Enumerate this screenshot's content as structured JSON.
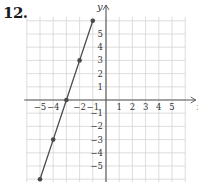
{
  "problem": {
    "number": "12."
  },
  "chart_data": {
    "type": "line",
    "title": "",
    "xlabel": "x",
    "ylabel": "y",
    "xlim": [
      -6,
      6
    ],
    "ylim": [
      -6,
      6
    ],
    "grid": true,
    "x_tick_labels": [
      "−5",
      "−4",
      "−2",
      "−1",
      "1",
      "2",
      "3",
      "4",
      "5"
    ],
    "x_tick_values": [
      -5,
      -4,
      -2,
      -1,
      1,
      2,
      3,
      4,
      5
    ],
    "y_tick_labels": [
      "5",
      "4",
      "3",
      "2",
      "1",
      "−1",
      "−2",
      "−3",
      "−4",
      "−5"
    ],
    "y_tick_values": [
      5,
      4,
      3,
      2,
      1,
      -1,
      -2,
      -3,
      -4,
      -5
    ],
    "series": [
      {
        "name": "line",
        "equation": "y = 3x + 9",
        "points": [
          {
            "x": -1,
            "y": 6
          },
          {
            "x": -2,
            "y": 3
          },
          {
            "x": -3,
            "y": 0
          },
          {
            "x": -4,
            "y": -3
          },
          {
            "x": -5,
            "y": -6
          }
        ]
      }
    ],
    "colors": {
      "grid": "#d4d4d4",
      "axis": "#555555",
      "line": "#4a4a4a",
      "point": "#4a4a4a",
      "label": "#333333"
    }
  }
}
